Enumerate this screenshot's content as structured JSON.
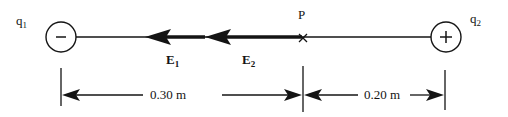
{
  "figure": {
    "background_color": "#ffffff",
    "stroke_color": "#141414",
    "width": 508,
    "height": 117
  },
  "charges": [
    {
      "id": "q1",
      "label": "q",
      "subscript": "1",
      "sign_glyph": "–",
      "sign": "negative",
      "cx": 61,
      "cy": 37,
      "r": 15
    },
    {
      "id": "q2",
      "label": "q",
      "subscript": "2",
      "sign_glyph": "+",
      "sign": "positive",
      "cx": 446,
      "cy": 37,
      "r": 15
    }
  ],
  "point": {
    "label": "P",
    "marker_glyph": "x",
    "x": 303,
    "y": 38
  },
  "field_vectors": [
    {
      "id": "E1",
      "label": "E",
      "subscript": "1",
      "direction": "left",
      "tail_x": 205,
      "tip_x": 145,
      "y": 37
    },
    {
      "id": "E2",
      "label": "E",
      "subscript": "2",
      "direction": "left",
      "tail_x": 302,
      "tip_x": 205,
      "y": 37
    }
  ],
  "dimensions": [
    {
      "id": "left-span",
      "value": "0.30 m",
      "from_x": 61,
      "to_x": 303,
      "y": 95
    },
    {
      "id": "right-span",
      "value": "0.20 m",
      "from_x": 303,
      "to_x": 446,
      "y": 95
    }
  ],
  "axis": {
    "y": 37,
    "left_x": 76,
    "right_x": 431
  }
}
